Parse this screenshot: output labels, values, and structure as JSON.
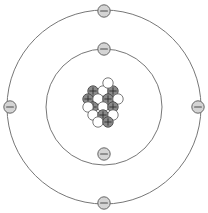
{
  "diagram": {
    "type": "bohr-atom",
    "background_color": "#ffffff"
  },
  "colors": {
    "orbit_stroke": "#777777",
    "electron_fill": "#d4d4d4",
    "electron_stroke": "#666666",
    "electron_sign_color": "#4a4a4a",
    "proton_fill": "#8a8a8a",
    "proton_stroke": "#4a4a4a",
    "neutron_fill": "#ffffff",
    "neutron_stroke": "#6a6a6a"
  },
  "center": {
    "x": 104,
    "y": 107
  },
  "shells": [
    {
      "name": "inner-shell",
      "radius": 58,
      "electron_count": 2,
      "electrons": [
        {
          "name": "inner-electron-top",
          "x": 104,
          "y": 49,
          "charge": "−"
        },
        {
          "name": "inner-electron-bottom",
          "x": 104,
          "y": 154,
          "charge": "−"
        }
      ]
    },
    {
      "name": "outer-shell",
      "radius": 97,
      "electron_count": 4,
      "electrons": [
        {
          "name": "outer-electron-top",
          "x": 104,
          "y": 11,
          "charge": "−"
        },
        {
          "name": "outer-electron-right",
          "x": 198,
          "y": 107,
          "charge": "−"
        },
        {
          "name": "outer-electron-bottom",
          "x": 104,
          "y": 203,
          "charge": "−"
        },
        {
          "name": "outer-electron-left",
          "x": 10,
          "y": 107,
          "charge": "−"
        }
      ]
    }
  ],
  "nucleus": {
    "name": "nucleus",
    "proton_count": 8,
    "neutron_count": 9,
    "particle_radius": 5.2,
    "particles": [
      {
        "type": "proton",
        "x": 93,
        "y": 91,
        "charge": "+"
      },
      {
        "type": "neutron",
        "x": 103,
        "y": 91,
        "charge": ""
      },
      {
        "type": "proton",
        "x": 113,
        "y": 91,
        "charge": "+"
      },
      {
        "type": "proton",
        "x": 88,
        "y": 99,
        "charge": "+"
      },
      {
        "type": "neutron",
        "x": 98,
        "y": 99,
        "charge": ""
      },
      {
        "type": "proton",
        "x": 108,
        "y": 99,
        "charge": "+"
      },
      {
        "type": "neutron",
        "x": 118,
        "y": 99,
        "charge": ""
      },
      {
        "type": "proton",
        "x": 93,
        "y": 107,
        "charge": "+"
      },
      {
        "type": "neutron",
        "x": 103,
        "y": 107,
        "charge": ""
      },
      {
        "type": "proton",
        "x": 113,
        "y": 107,
        "charge": "+"
      },
      {
        "type": "neutron",
        "x": 88,
        "y": 107,
        "charge": ""
      },
      {
        "type": "neutron",
        "x": 93,
        "y": 115,
        "charge": ""
      },
      {
        "type": "proton",
        "x": 103,
        "y": 115,
        "charge": "+"
      },
      {
        "type": "neutron",
        "x": 113,
        "y": 115,
        "charge": ""
      },
      {
        "type": "neutron",
        "x": 98,
        "y": 122,
        "charge": ""
      },
      {
        "type": "proton",
        "x": 108,
        "y": 122,
        "charge": "+"
      },
      {
        "type": "neutron",
        "x": 108,
        "y": 83,
        "charge": ""
      }
    ]
  }
}
